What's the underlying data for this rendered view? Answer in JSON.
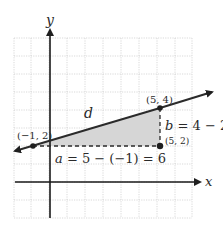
{
  "diagram": {
    "axes": {
      "x_label": "x",
      "y_label": "y"
    },
    "points": [
      {
        "name": "P1",
        "label": "(−1, 2)",
        "x": -1,
        "y": 2
      },
      {
        "name": "P2",
        "label": "(5, 4)",
        "x": 5,
        "y": 4
      },
      {
        "name": "P3",
        "label": "(5, 2)",
        "x": 5,
        "y": 2
      }
    ],
    "segment_label": "d",
    "horizontal_leg": {
      "label_a": "a",
      "expr": " = 5 − (−1) = 6"
    },
    "vertical_leg": {
      "label_b": "b",
      "expr": " = 4 − 2 = 2"
    },
    "colors": {
      "grid": "#c8c8c8",
      "axis": "#1a1a1a",
      "line": "#2b2b2b",
      "fill": "#d6d6d6",
      "text": "#2a2a2a"
    }
  }
}
